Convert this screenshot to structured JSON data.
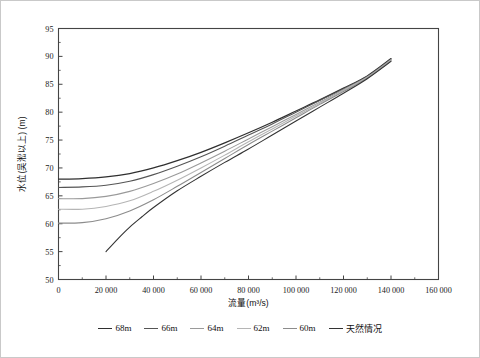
{
  "chart_data": {
    "type": "line",
    "title": "",
    "xlabel": "流量(m³/s)",
    "ylabel": "水位(吴淞以上) (m)",
    "xlim": [
      0,
      160000
    ],
    "ylim": [
      50,
      95
    ],
    "xticks": [
      "0",
      "20 000",
      "40 000",
      "60 000",
      "80 000",
      "100 000",
      "120 000",
      "140 000",
      "160 000"
    ],
    "xtick_values": [
      0,
      20000,
      40000,
      60000,
      80000,
      100000,
      120000,
      140000,
      160000
    ],
    "yticks": [
      "50",
      "55",
      "60",
      "65",
      "70",
      "75",
      "80",
      "85",
      "90",
      "95"
    ],
    "ytick_values": [
      50,
      55,
      60,
      65,
      70,
      75,
      80,
      85,
      90,
      95
    ],
    "grid": false,
    "legend_position": "bottom",
    "x": [
      0,
      10000,
      20000,
      30000,
      40000,
      50000,
      60000,
      70000,
      80000,
      90000,
      100000,
      110000,
      120000,
      130000,
      140000
    ],
    "series": [
      {
        "name": "68m",
        "color": "#2f2f2f",
        "width": 1.25,
        "values": [
          68.0,
          68.1,
          68.4,
          69.0,
          70.0,
          71.3,
          72.8,
          74.5,
          76.3,
          78.2,
          80.2,
          82.2,
          84.3,
          86.5,
          89.6
        ]
      },
      {
        "name": "66m",
        "color": "#555555",
        "width": 1.1,
        "values": [
          66.5,
          66.6,
          66.9,
          67.6,
          68.8,
          70.3,
          72.0,
          73.9,
          75.9,
          77.9,
          80.0,
          82.1,
          84.2,
          86.4,
          89.5
        ]
      },
      {
        "name": "64m",
        "color": "#9a9a9a",
        "width": 1.1,
        "values": [
          64.5,
          64.5,
          64.9,
          65.8,
          67.2,
          68.9,
          70.9,
          73.0,
          75.2,
          77.4,
          79.6,
          81.8,
          84.0,
          86.3,
          89.4
        ]
      },
      {
        "name": "62m",
        "color": "#b5b5b5",
        "width": 1.1,
        "values": [
          62.6,
          62.6,
          63.1,
          64.1,
          65.8,
          67.8,
          70.0,
          72.3,
          74.7,
          77.0,
          79.3,
          81.6,
          83.9,
          86.2,
          89.3
        ]
      },
      {
        "name": "60m",
        "color": "#8c8c8c",
        "width": 1.1,
        "values": [
          60.1,
          60.2,
          60.9,
          62.3,
          64.3,
          66.7,
          69.2,
          71.7,
          74.2,
          76.6,
          79.0,
          81.4,
          83.7,
          86.1,
          89.2
        ]
      },
      {
        "name": "天然情况",
        "color": "#333333",
        "width": 1.1,
        "x": [
          20000,
          25000,
          30000,
          35000,
          40000,
          50000,
          60000,
          70000,
          80000,
          90000,
          100000,
          110000,
          120000,
          130000,
          140000
        ],
        "values": [
          55.0,
          57.3,
          59.4,
          61.2,
          62.9,
          65.9,
          68.5,
          71.0,
          73.4,
          75.9,
          78.4,
          80.9,
          83.4,
          86.0,
          89.1
        ]
      }
    ]
  },
  "legend": {
    "items": [
      {
        "label": "68m",
        "color": "#2f2f2f"
      },
      {
        "label": "66m",
        "color": "#555555"
      },
      {
        "label": "64m",
        "color": "#9a9a9a"
      },
      {
        "label": "62m",
        "color": "#b5b5b5"
      },
      {
        "label": "60m",
        "color": "#8c8c8c"
      },
      {
        "label": "天然情况",
        "color": "#333333"
      }
    ]
  }
}
